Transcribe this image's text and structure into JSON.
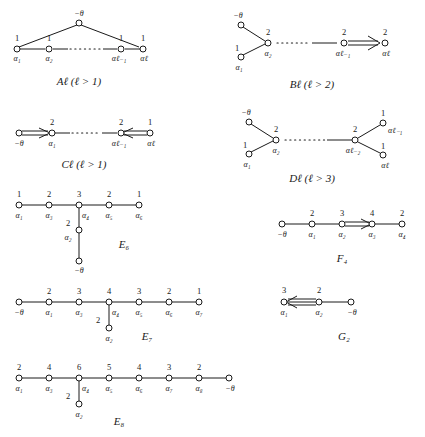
{
  "figure": {
    "theta_label": "−θ"
  },
  "diagrams": [
    {
      "id": "A",
      "caption": "Aℓ (ℓ > 1)",
      "caption_base": "A",
      "caption_sub": "ℓ",
      "caption_cond": "(ℓ > 1)",
      "top_node_label": "−θ",
      "marks": [
        "1",
        "1",
        "1",
        "1"
      ],
      "node_labels": [
        "α₁",
        "α₂",
        "αℓ₋₁",
        "αℓ"
      ],
      "has_dots": true,
      "shape": "cycle-triangle"
    },
    {
      "id": "B",
      "caption": "Bℓ (ℓ > 2)",
      "caption_base": "B",
      "caption_sub": "ℓ",
      "caption_cond": "(ℓ > 2)",
      "branch_node_label": "−θ",
      "marks": [
        "1",
        "2",
        "2",
        "2"
      ],
      "node_labels": [
        "α₁",
        "α₂",
        "αℓ₋₁",
        "αℓ"
      ],
      "has_dots": true,
      "arrow": "double-right",
      "shape": "fork-left-arrow-right"
    },
    {
      "id": "C",
      "caption": "Cℓ (ℓ > 1)",
      "caption_base": "C",
      "caption_sub": "ℓ",
      "caption_cond": "(ℓ > 1)",
      "marks": [
        "",
        "2",
        "2",
        "1"
      ],
      "node_labels": [
        "−θ",
        "α₁",
        "αℓ₋₁",
        "αℓ"
      ],
      "has_dots": true,
      "arrow_left": "double-right",
      "arrow_right": "double-left",
      "shape": "chain-two-arrows"
    },
    {
      "id": "D",
      "caption": "Dℓ (ℓ > 3)",
      "caption_base": "D",
      "caption_sub": "ℓ",
      "caption_cond": "(ℓ > 3)",
      "marks": [
        "1",
        "2",
        "2",
        "1",
        "1"
      ],
      "node_labels": [
        "α₁",
        "α₂",
        "αℓ₋₂",
        "αℓ₋₁",
        "αℓ"
      ],
      "branch_node_label": "−θ",
      "has_dots": true,
      "shape": "double-fork"
    },
    {
      "id": "E6",
      "caption": "E₆",
      "caption_base": "E",
      "caption_sub": "6",
      "marks": [
        "1",
        "2",
        "3",
        "2",
        "1"
      ],
      "node_labels": [
        "α₁",
        "α₃",
        "α₄",
        "α₅",
        "α₆"
      ],
      "branch_mark": "2",
      "branch_label": "α₂",
      "bottom_label": "−θ",
      "shape": "E6"
    },
    {
      "id": "F4",
      "caption": "F₄",
      "caption_base": "F",
      "caption_sub": "4",
      "marks": [
        "",
        "2",
        "3",
        "4",
        "2"
      ],
      "node_labels": [
        "−θ",
        "α₁",
        "α₂",
        "α₃",
        "α₄"
      ],
      "arrow": "double-right",
      "arrow_between": [
        2,
        3
      ],
      "shape": "chain-arrow"
    },
    {
      "id": "E7",
      "caption": "E₇",
      "caption_base": "E",
      "caption_sub": "7",
      "marks": [
        "",
        "2",
        "3",
        "4",
        "3",
        "2",
        "1"
      ],
      "node_labels": [
        "−θ",
        "α₁",
        "α₃",
        "α₄",
        "α₅",
        "α₆",
        "α₇"
      ],
      "branch_mark": "2",
      "branch_label": "α₂",
      "shape": "E7"
    },
    {
      "id": "G2",
      "caption": "G₂",
      "caption_base": "G",
      "caption_sub": "2",
      "marks": [
        "3",
        "2",
        ""
      ],
      "node_labels": [
        "α₁",
        "α₂",
        "−θ"
      ],
      "arrow": "triple-left",
      "shape": "chain-triple-arrow"
    },
    {
      "id": "E8",
      "caption": "E₈",
      "caption_base": "E",
      "caption_sub": "8",
      "marks": [
        "2",
        "4",
        "6",
        "5",
        "4",
        "3",
        "2",
        ""
      ],
      "node_labels": [
        "α₁",
        "α₃",
        "α₄",
        "α₅",
        "α₆",
        "α₇",
        "α₈",
        "−θ"
      ],
      "branch_mark": "2",
      "branch_label": "α₂",
      "shape": "E8"
    }
  ],
  "colors": {
    "ink": "#1a1a1a",
    "paper": "#ffffff"
  }
}
